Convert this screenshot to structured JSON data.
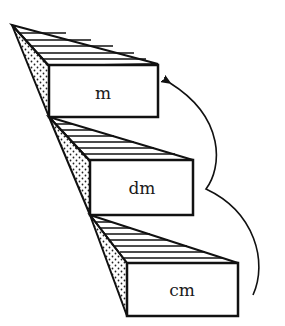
{
  "diagram": {
    "type": "staircase-of-metric-units",
    "steps": [
      {
        "label": "m",
        "level": "top"
      },
      {
        "label": "dm",
        "level": "middle"
      },
      {
        "label": "cm",
        "level": "bottom"
      }
    ],
    "arrow": {
      "from": "cm",
      "to": "m",
      "direction": "upward",
      "style": "curved"
    },
    "colors": {
      "stroke": "#111111",
      "background": "#ffffff",
      "dots": "#222222"
    }
  }
}
